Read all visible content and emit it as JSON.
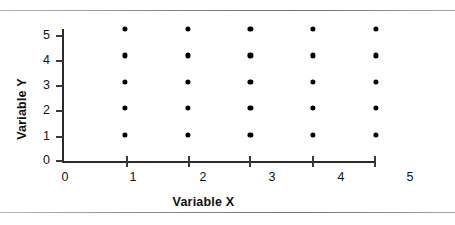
{
  "figure": {
    "type": "scatter-plot",
    "background_color": "#ffffff",
    "ink_color": "#000000",
    "top_rule_label": "page-rule-top",
    "bottom_rule_label": "page-rule-bottom"
  },
  "chart_data": {
    "type": "scatter",
    "title": "",
    "xlabel": "Variable X",
    "ylabel": "Variable Y",
    "xlim": [
      0,
      5
    ],
    "ylim": [
      0,
      5
    ],
    "xticks": [
      0,
      1,
      2,
      3,
      4,
      5
    ],
    "yticks": [
      0,
      1,
      2,
      3,
      4,
      5
    ],
    "xtick_labels": [
      "0",
      "1",
      "2",
      "3",
      "4",
      "5"
    ],
    "ytick_labels": [
      "0",
      "1",
      "2",
      "3",
      "4",
      "5"
    ],
    "grid": false,
    "legend": null,
    "marker": "filled-circle",
    "marker_color": "#000000",
    "series": [
      {
        "name": "points",
        "points": [
          {
            "x": 1,
            "y": 1
          },
          {
            "x": 1,
            "y": 2
          },
          {
            "x": 1,
            "y": 3
          },
          {
            "x": 1,
            "y": 4
          },
          {
            "x": 1,
            "y": 5
          },
          {
            "x": 2,
            "y": 1
          },
          {
            "x": 2,
            "y": 2
          },
          {
            "x": 2,
            "y": 3
          },
          {
            "x": 2,
            "y": 4
          },
          {
            "x": 2,
            "y": 5
          },
          {
            "x": 3,
            "y": 1
          },
          {
            "x": 3,
            "y": 2
          },
          {
            "x": 3,
            "y": 3
          },
          {
            "x": 3,
            "y": 4
          },
          {
            "x": 3,
            "y": 5
          },
          {
            "x": 4,
            "y": 1
          },
          {
            "x": 4,
            "y": 2
          },
          {
            "x": 4,
            "y": 3
          },
          {
            "x": 4,
            "y": 4
          },
          {
            "x": 4,
            "y": 5
          },
          {
            "x": 5,
            "y": 1
          },
          {
            "x": 5,
            "y": 2
          },
          {
            "x": 5,
            "y": 3
          },
          {
            "x": 5,
            "y": 4
          },
          {
            "x": 5,
            "y": 5
          }
        ]
      }
    ],
    "point_count": 25
  },
  "layout": {
    "plot_left_px": 62,
    "plot_right_px": 376,
    "plot_top_px": 18,
    "plot_bottom_px": 150,
    "x_tick_px": [
      62,
      127,
      189,
      250,
      313,
      375
    ],
    "x_label_px": [
      65,
      133,
      203,
      272,
      341,
      410
    ],
    "y_tick_px": [
      150,
      126,
      100,
      75,
      50,
      25
    ],
    "y_label_px": [
      150,
      126,
      100,
      75,
      50,
      25
    ]
  }
}
